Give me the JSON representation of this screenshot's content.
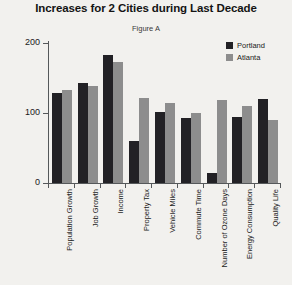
{
  "chart_data": {
    "type": "bar",
    "title": "Increases for 2 Cities during Last Decade",
    "subtitle": "Figure A",
    "xlabel": "",
    "ylabel": "Growth Index",
    "ylim": [
      0,
      200
    ],
    "yticks": [
      0,
      100,
      200
    ],
    "grid": false,
    "legend_position": "top-right",
    "categories": [
      "Population Growth",
      "Job Growth",
      "Income",
      "Property Tax",
      "Vehicle Miles",
      "Commute Time",
      "Number of Ozone Days",
      "Energy Consumption",
      "Quality Life"
    ],
    "series": [
      {
        "name": "Portland",
        "color": "#222125",
        "values": [
          128,
          143,
          183,
          60,
          101,
          93,
          15,
          95,
          120
        ]
      },
      {
        "name": "Atlanta",
        "color": "#8d8d8d",
        "values": [
          133,
          138,
          173,
          122,
          115,
          100,
          118,
          110,
          90
        ]
      }
    ]
  }
}
